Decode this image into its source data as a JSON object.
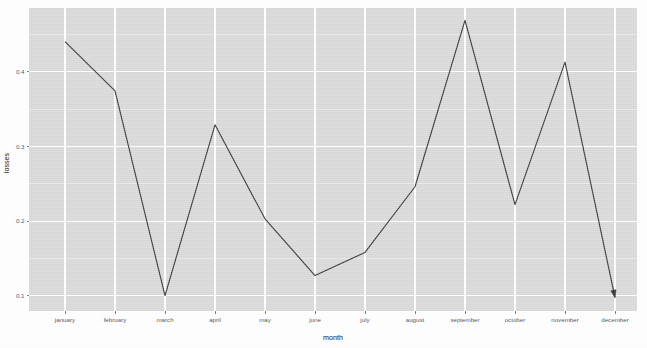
{
  "chart_data": {
    "type": "line",
    "title": "",
    "subtitle": "",
    "xlabel": "month",
    "ylabel": "losses",
    "categories": [
      "january",
      "february",
      "march",
      "april",
      "may",
      "june",
      "july",
      "august",
      "september",
      "october",
      "november",
      "december"
    ],
    "values": [
      0.4405,
      0.3745,
      0.1,
      0.329,
      0.203,
      0.127,
      0.158,
      0.246,
      0.469,
      0.222,
      0.413,
      0.0974
    ],
    "series": [
      {
        "name": "losses",
        "values": [
          0.4405,
          0.3745,
          0.1,
          0.329,
          0.203,
          0.127,
          0.158,
          0.246,
          0.469,
          0.222,
          0.413,
          0.0974
        ]
      }
    ],
    "ylim": [
      0.0795,
      0.4855
    ],
    "xtick_labels": [
      "january",
      "february",
      "march",
      "april",
      "may",
      "june",
      "july",
      "august",
      "september",
      "october",
      "november",
      "december"
    ],
    "ytick_labels": [
      "0.1",
      "0.2",
      "0.3",
      "0.4"
    ],
    "ytick_values": [
      0.1,
      0.2,
      0.3,
      0.4
    ],
    "yminor_values": [
      0.15,
      0.25,
      0.35,
      0.45
    ],
    "grid": true,
    "grid_color": "#ffffff",
    "panel_color": "#d9d9d9",
    "line_color": "#333333",
    "legend": "none",
    "legend_position": "none",
    "annotations": [
      {
        "type": "arrowhead",
        "at_category": "december",
        "at_value": 0.0974,
        "description": "arrow marker at end of line"
      }
    ]
  },
  "axes": {
    "y_title": "losses",
    "x_title": "month"
  }
}
